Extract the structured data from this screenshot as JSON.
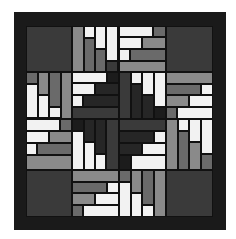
{
  "image": {
    "subject": "log cabin quilt block pattern",
    "colors": {
      "white": "#f2f2f2",
      "light_gray": "#8a8a8a",
      "mid_gray": "#6a6a6a",
      "dark_gray": "#3a3a3a",
      "charcoal": "#262626",
      "border": "#1a1a1a"
    },
    "pieces": [
      {
        "x": 0,
        "y": 0,
        "w": 46,
        "h": 46,
        "c": "D"
      },
      {
        "x": 140,
        "y": 0,
        "w": 47,
        "h": 46,
        "c": "D"
      },
      {
        "x": 0,
        "y": 144,
        "w": 46,
        "h": 47,
        "c": "D"
      },
      {
        "x": 140,
        "y": 144,
        "w": 47,
        "h": 47,
        "c": "D"
      },
      {
        "x": 46,
        "y": 0,
        "w": 12,
        "h": 46,
        "c": "L"
      },
      {
        "x": 58,
        "y": 0,
        "w": 11,
        "h": 12,
        "c": "W"
      },
      {
        "x": 58,
        "y": 12,
        "w": 11,
        "h": 34,
        "c": "M"
      },
      {
        "x": 69,
        "y": 0,
        "w": 11,
        "h": 23,
        "c": "W"
      },
      {
        "x": 69,
        "y": 23,
        "w": 11,
        "h": 23,
        "c": "M"
      },
      {
        "x": 80,
        "y": 0,
        "w": 12,
        "h": 35,
        "c": "W"
      },
      {
        "x": 80,
        "y": 35,
        "w": 12,
        "h": 11,
        "c": "D"
      },
      {
        "x": 93,
        "y": 0,
        "w": 34,
        "h": 11,
        "c": "W"
      },
      {
        "x": 127,
        "y": 0,
        "w": 13,
        "h": 11,
        "c": "M"
      },
      {
        "x": 93,
        "y": 11,
        "w": 23,
        "h": 12,
        "c": "W"
      },
      {
        "x": 116,
        "y": 11,
        "w": 24,
        "h": 12,
        "c": "L"
      },
      {
        "x": 93,
        "y": 23,
        "w": 11,
        "h": 12,
        "c": "W"
      },
      {
        "x": 104,
        "y": 23,
        "w": 36,
        "h": 12,
        "c": "M"
      },
      {
        "x": 93,
        "y": 35,
        "w": 47,
        "h": 11,
        "c": "L"
      },
      {
        "x": 0,
        "y": 46,
        "w": 12,
        "h": 12,
        "c": "M"
      },
      {
        "x": 0,
        "y": 58,
        "w": 12,
        "h": 34,
        "c": "W"
      },
      {
        "x": 12,
        "y": 46,
        "w": 11,
        "h": 23,
        "c": "L"
      },
      {
        "x": 12,
        "y": 69,
        "w": 11,
        "h": 23,
        "c": "W"
      },
      {
        "x": 23,
        "y": 46,
        "w": 12,
        "h": 35,
        "c": "M"
      },
      {
        "x": 23,
        "y": 81,
        "w": 12,
        "h": 11,
        "c": "W"
      },
      {
        "x": 35,
        "y": 46,
        "w": 11,
        "h": 47,
        "c": "L"
      },
      {
        "x": 0,
        "y": 93,
        "w": 34,
        "h": 12,
        "c": "W"
      },
      {
        "x": 34,
        "y": 93,
        "w": 12,
        "h": 12,
        "c": "M"
      },
      {
        "x": 0,
        "y": 105,
        "w": 23,
        "h": 12,
        "c": "W"
      },
      {
        "x": 23,
        "y": 105,
        "w": 23,
        "h": 12,
        "c": "L"
      },
      {
        "x": 0,
        "y": 117,
        "w": 11,
        "h": 12,
        "c": "W"
      },
      {
        "x": 11,
        "y": 117,
        "w": 35,
        "h": 12,
        "c": "M"
      },
      {
        "x": 0,
        "y": 129,
        "w": 46,
        "h": 15,
        "c": "L"
      },
      {
        "x": 46,
        "y": 46,
        "w": 35,
        "h": 11,
        "c": "W"
      },
      {
        "x": 81,
        "y": 46,
        "w": 12,
        "h": 11,
        "c": "X"
      },
      {
        "x": 46,
        "y": 57,
        "w": 23,
        "h": 12,
        "c": "W"
      },
      {
        "x": 69,
        "y": 57,
        "w": 24,
        "h": 12,
        "c": "K"
      },
      {
        "x": 46,
        "y": 69,
        "w": 11,
        "h": 12,
        "c": "W"
      },
      {
        "x": 57,
        "y": 69,
        "w": 36,
        "h": 12,
        "c": "K"
      },
      {
        "x": 46,
        "y": 81,
        "w": 47,
        "h": 12,
        "c": "D"
      },
      {
        "x": 93,
        "y": 46,
        "w": 12,
        "h": 47,
        "c": "D"
      },
      {
        "x": 105,
        "y": 46,
        "w": 11,
        "h": 12,
        "c": "W"
      },
      {
        "x": 105,
        "y": 58,
        "w": 11,
        "h": 35,
        "c": "K"
      },
      {
        "x": 116,
        "y": 46,
        "w": 12,
        "h": 23,
        "c": "W"
      },
      {
        "x": 116,
        "y": 69,
        "w": 12,
        "h": 24,
        "c": "K"
      },
      {
        "x": 128,
        "y": 46,
        "w": 12,
        "h": 35,
        "c": "W"
      },
      {
        "x": 128,
        "y": 81,
        "w": 12,
        "h": 12,
        "c": "X"
      },
      {
        "x": 46,
        "y": 93,
        "w": 12,
        "h": 12,
        "c": "X"
      },
      {
        "x": 46,
        "y": 105,
        "w": 12,
        "h": 39,
        "c": "W"
      },
      {
        "x": 58,
        "y": 93,
        "w": 11,
        "h": 23,
        "c": "K"
      },
      {
        "x": 58,
        "y": 116,
        "w": 11,
        "h": 28,
        "c": "W"
      },
      {
        "x": 69,
        "y": 93,
        "w": 11,
        "h": 35,
        "c": "K"
      },
      {
        "x": 69,
        "y": 128,
        "w": 11,
        "h": 16,
        "c": "W"
      },
      {
        "x": 80,
        "y": 93,
        "w": 13,
        "h": 51,
        "c": "D"
      },
      {
        "x": 93,
        "y": 93,
        "w": 47,
        "h": 12,
        "c": "D"
      },
      {
        "x": 93,
        "y": 105,
        "w": 35,
        "h": 12,
        "c": "K"
      },
      {
        "x": 128,
        "y": 105,
        "w": 12,
        "h": 12,
        "c": "W"
      },
      {
        "x": 93,
        "y": 117,
        "w": 23,
        "h": 12,
        "c": "K"
      },
      {
        "x": 116,
        "y": 117,
        "w": 24,
        "h": 12,
        "c": "W"
      },
      {
        "x": 93,
        "y": 129,
        "w": 12,
        "h": 15,
        "c": "X"
      },
      {
        "x": 105,
        "y": 129,
        "w": 35,
        "h": 15,
        "c": "W"
      },
      {
        "x": 140,
        "y": 46,
        "w": 47,
        "h": 12,
        "c": "L"
      },
      {
        "x": 140,
        "y": 58,
        "w": 35,
        "h": 11,
        "c": "M"
      },
      {
        "x": 175,
        "y": 58,
        "w": 12,
        "h": 11,
        "c": "W"
      },
      {
        "x": 140,
        "y": 69,
        "w": 23,
        "h": 12,
        "c": "L"
      },
      {
        "x": 163,
        "y": 69,
        "w": 24,
        "h": 12,
        "c": "W"
      },
      {
        "x": 140,
        "y": 81,
        "w": 11,
        "h": 12,
        "c": "M"
      },
      {
        "x": 151,
        "y": 81,
        "w": 36,
        "h": 12,
        "c": "W"
      },
      {
        "x": 140,
        "y": 93,
        "w": 12,
        "h": 51,
        "c": "L"
      },
      {
        "x": 152,
        "y": 93,
        "w": 11,
        "h": 12,
        "c": "W"
      },
      {
        "x": 152,
        "y": 105,
        "w": 11,
        "h": 39,
        "c": "M"
      },
      {
        "x": 163,
        "y": 93,
        "w": 12,
        "h": 23,
        "c": "W"
      },
      {
        "x": 163,
        "y": 116,
        "w": 12,
        "h": 28,
        "c": "L"
      },
      {
        "x": 175,
        "y": 93,
        "w": 12,
        "h": 35,
        "c": "W"
      },
      {
        "x": 175,
        "y": 128,
        "w": 12,
        "h": 16,
        "c": "M"
      },
      {
        "x": 46,
        "y": 144,
        "w": 47,
        "h": 12,
        "c": "L"
      },
      {
        "x": 46,
        "y": 156,
        "w": 35,
        "h": 11,
        "c": "M"
      },
      {
        "x": 81,
        "y": 156,
        "w": 12,
        "h": 11,
        "c": "W"
      },
      {
        "x": 46,
        "y": 167,
        "w": 23,
        "h": 12,
        "c": "L"
      },
      {
        "x": 69,
        "y": 167,
        "w": 24,
        "h": 12,
        "c": "W"
      },
      {
        "x": 46,
        "y": 179,
        "w": 11,
        "h": 12,
        "c": "M"
      },
      {
        "x": 57,
        "y": 179,
        "w": 36,
        "h": 12,
        "c": "W"
      },
      {
        "x": 93,
        "y": 144,
        "w": 12,
        "h": 12,
        "c": "M"
      },
      {
        "x": 93,
        "y": 156,
        "w": 12,
        "h": 35,
        "c": "W"
      },
      {
        "x": 105,
        "y": 144,
        "w": 11,
        "h": 23,
        "c": "L"
      },
      {
        "x": 105,
        "y": 167,
        "w": 11,
        "h": 24,
        "c": "W"
      },
      {
        "x": 116,
        "y": 144,
        "w": 12,
        "h": 35,
        "c": "M"
      },
      {
        "x": 116,
        "y": 179,
        "w": 12,
        "h": 12,
        "c": "W"
      },
      {
        "x": 128,
        "y": 144,
        "w": 12,
        "h": 47,
        "c": "L"
      }
    ]
  }
}
